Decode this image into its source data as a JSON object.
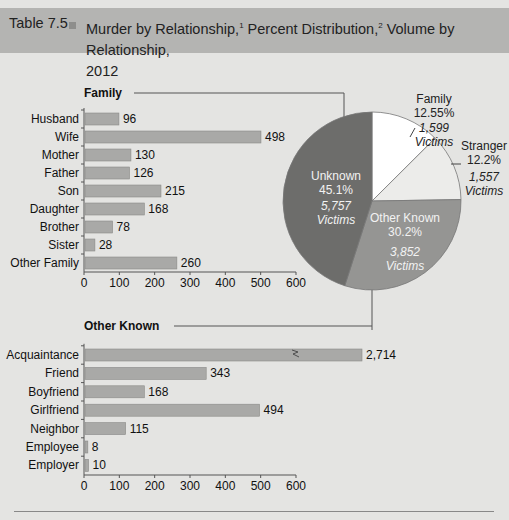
{
  "header": {
    "table_number": "Table 7.5",
    "title_part1": "Murder by Relationship,",
    "sup1": "1",
    "title_part2": " Percent Distribution,",
    "sup2": "2",
    "title_part3": " Volume by Relationship,",
    "title_line2": "2012"
  },
  "colors": {
    "bar": "#a9a9a7",
    "unknown": "#6d6d6b",
    "other_known": "#959593",
    "family": "#ffffff",
    "stranger": "#ececea",
    "header": "#b4b4b2",
    "bg": "#e4e4e2"
  },
  "chart_data": [
    {
      "type": "bar",
      "title": "Family",
      "categories": [
        "Husband",
        "Wife",
        "Mother",
        "Father",
        "Son",
        "Daughter",
        "Brother",
        "Sister",
        "Other Family"
      ],
      "values": [
        96,
        498,
        130,
        126,
        215,
        168,
        78,
        28,
        260
      ],
      "value_labels": [
        "96",
        "498",
        "130",
        "126",
        "215",
        "168",
        "78",
        "28",
        "260"
      ],
      "xticks": [
        "0",
        "100",
        "200",
        "300",
        "400",
        "500",
        "600"
      ],
      "xlim": [
        0,
        600
      ],
      "orientation": "horizontal"
    },
    {
      "type": "bar",
      "title": "Other Known",
      "categories": [
        "Acquaintance",
        "Friend",
        "Boyfriend",
        "Girlfriend",
        "Neighbor",
        "Employee",
        "Employer"
      ],
      "values": [
        2714,
        343,
        168,
        494,
        115,
        8,
        10
      ],
      "value_labels": [
        "2,714",
        "343",
        "168",
        "494",
        "115",
        "8",
        "10"
      ],
      "xticks": [
        "0",
        "100",
        "200",
        "300",
        "400",
        "500",
        "600"
      ],
      "xlim": [
        0,
        600
      ],
      "axis_break": "Acquaintance bar truncated with break symbol",
      "orientation": "horizontal"
    },
    {
      "type": "pie",
      "slices": [
        {
          "label": "Unknown",
          "percent": "45.1%",
          "victims": "5,757",
          "victims_label": "Victims",
          "value": 45.1
        },
        {
          "label": "Family",
          "percent": "12.55%",
          "victims": "1,599",
          "victims_label": "Victims",
          "value": 12.55
        },
        {
          "label": "Stranger",
          "percent": "12.2%",
          "victims": "1,557",
          "victims_label": "Victims",
          "value": 12.2
        },
        {
          "label": "Other Known",
          "percent": "30.2%",
          "victims": "3,852",
          "victims_label": "Victims",
          "value": 30.2
        }
      ]
    }
  ]
}
